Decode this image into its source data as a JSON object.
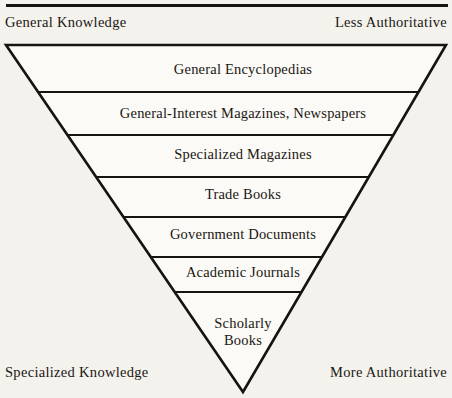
{
  "figure": {
    "background_color": "#f4f2ec",
    "ink_color": "#17140f"
  },
  "corner_labels": {
    "top_left": "General Knowledge",
    "top_right": "Less Authoritative",
    "bottom_left": "Specialized Knowledge",
    "bottom_right": "More Authoritative"
  },
  "chart_data": {
    "type": "diagram",
    "shape": "inverted-triangle",
    "axis_hint_top": "General Knowledge / Less Authoritative",
    "axis_hint_bottom": "Specialized Knowledge / More Authoritative",
    "apex": {
      "x": 243,
      "y": 392
    },
    "top_edge": {
      "left_x": 6,
      "right_x": 446,
      "y": 45
    },
    "bands": [
      {
        "label": "General Encyclopedias",
        "top_y": 45,
        "bottom_y": 92,
        "text_y": 74,
        "text_lines": [
          "General Encyclopedias"
        ]
      },
      {
        "label": "General-Interest Magazines, Newspapers",
        "top_y": 92,
        "bottom_y": 135,
        "text_y": 118,
        "text_lines": [
          "General-Interest Magazines, Newspapers"
        ]
      },
      {
        "label": "Specialized Magazines",
        "top_y": 135,
        "bottom_y": 177,
        "text_y": 159,
        "text_lines": [
          "Specialized Magazines"
        ]
      },
      {
        "label": "Trade Books",
        "top_y": 177,
        "bottom_y": 217,
        "text_y": 199,
        "text_lines": [
          "Trade Books"
        ]
      },
      {
        "label": "Government Documents",
        "top_y": 217,
        "bottom_y": 257,
        "text_y": 239,
        "text_lines": [
          "Government Documents"
        ]
      },
      {
        "label": "Academic Journals",
        "top_y": 257,
        "bottom_y": 292,
        "text_y": 277,
        "text_lines": [
          "Academic Journals"
        ]
      },
      {
        "label": "Scholarly Books",
        "top_y": 292,
        "bottom_y": 392,
        "text_y": 328,
        "text_lines": [
          "Scholarly",
          "Books"
        ]
      }
    ]
  }
}
